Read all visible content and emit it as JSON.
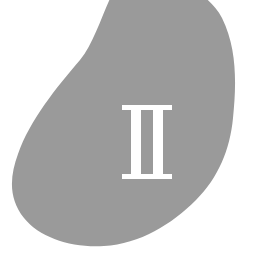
{
  "page": {
    "kind": "book-part-divider",
    "width": 263,
    "height": 263,
    "background_color": "#ffffff"
  },
  "blob": {
    "name": "decorative-blob-shape",
    "description": "large organic teardrop shape bleeding off the top edge",
    "fill_color": "#9a9a9a",
    "bounds": {
      "left": 11,
      "top": 0,
      "right": 234,
      "bottom": 246
    },
    "path": "M 125 -20 C 168 -22 205 -14 222 18 C 238 50 236 88 233 118 C 230 150 218 178 196 200 C 172 224 140 244 104 246 C 72 248 40 238 24 218 C 8 198 10 176 18 154 C 30 120 56 88 80 60 C 100 36 110 -18 125 -20 Z"
  },
  "numeral": {
    "name": "part-number",
    "value": "II",
    "roman": "II",
    "arabic": 2,
    "color": "#ffffff",
    "style": "serif-slab",
    "position": {
      "left": 122,
      "top": 105,
      "width": 50,
      "height": 74
    },
    "stem_count": 2
  }
}
